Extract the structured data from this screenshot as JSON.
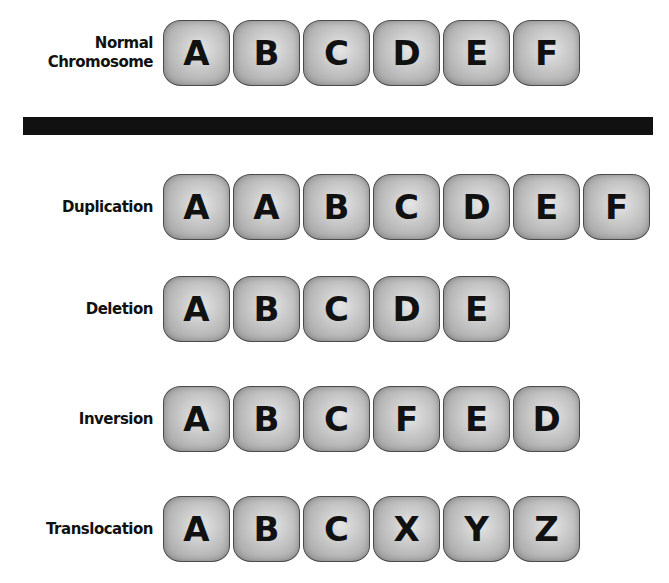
{
  "rows": [
    {
      "key": "normal",
      "label_lines": [
        "Normal",
        "Chromosome"
      ],
      "segments": [
        "A",
        "B",
        "C",
        "D",
        "E",
        "F"
      ]
    },
    {
      "key": "duplication",
      "label": "Duplication",
      "segments": [
        "A",
        "A",
        "B",
        "C",
        "D",
        "E",
        "F"
      ]
    },
    {
      "key": "deletion",
      "label": "Deletion",
      "segments": [
        "A",
        "B",
        "C",
        "D",
        "E"
      ]
    },
    {
      "key": "inversion",
      "label": "Inversion",
      "segments": [
        "A",
        "B",
        "C",
        "F",
        "E",
        "D"
      ]
    },
    {
      "key": "translocation",
      "label": "Translocation",
      "segments": [
        "A",
        "B",
        "C",
        "X",
        "Y",
        "Z"
      ]
    }
  ],
  "colors": {
    "segment_fill": "#c4c4c4",
    "segment_border": "#4a4a4a",
    "divider": "#111111",
    "text": "#111111"
  }
}
